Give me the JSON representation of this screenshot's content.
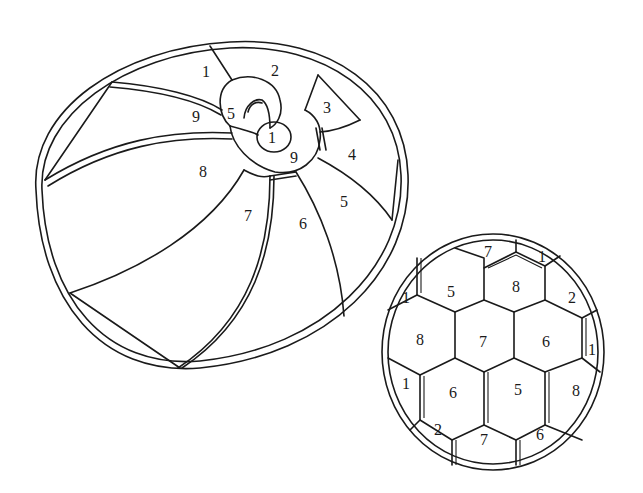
{
  "figures": [
    {
      "name": "beach-ball",
      "regions": [
        {
          "label": "1",
          "x": 206,
          "y": 72
        },
        {
          "label": "2",
          "x": 275,
          "y": 71
        },
        {
          "label": "3",
          "x": 327,
          "y": 108
        },
        {
          "label": "9",
          "x": 196,
          "y": 117
        },
        {
          "label": "5",
          "x": 231,
          "y": 114
        },
        {
          "label": "1",
          "x": 272,
          "y": 138
        },
        {
          "label": "4",
          "x": 352,
          "y": 155
        },
        {
          "label": "9",
          "x": 294,
          "y": 158
        },
        {
          "label": "8",
          "x": 203,
          "y": 172
        },
        {
          "label": "5",
          "x": 344,
          "y": 202
        },
        {
          "label": "7",
          "x": 248,
          "y": 216
        },
        {
          "label": "6",
          "x": 303,
          "y": 224
        }
      ]
    },
    {
      "name": "soccer-ball",
      "regions": [
        {
          "label": "7",
          "x": 488,
          "y": 252
        },
        {
          "label": "1",
          "x": 542,
          "y": 257
        },
        {
          "label": "5",
          "x": 451,
          "y": 292
        },
        {
          "label": "8",
          "x": 516,
          "y": 287
        },
        {
          "label": "1",
          "x": 406,
          "y": 298
        },
        {
          "label": "2",
          "x": 572,
          "y": 298
        },
        {
          "label": "8",
          "x": 420,
          "y": 340
        },
        {
          "label": "7",
          "x": 483,
          "y": 342
        },
        {
          "label": "6",
          "x": 546,
          "y": 342
        },
        {
          "label": "1",
          "x": 592,
          "y": 350
        },
        {
          "label": "1",
          "x": 406,
          "y": 384
        },
        {
          "label": "6",
          "x": 453,
          "y": 393
        },
        {
          "label": "5",
          "x": 518,
          "y": 390
        },
        {
          "label": "8",
          "x": 576,
          "y": 391
        },
        {
          "label": "2",
          "x": 438,
          "y": 430
        },
        {
          "label": "7",
          "x": 484,
          "y": 440
        },
        {
          "label": "6",
          "x": 540,
          "y": 435
        }
      ]
    }
  ],
  "colors": {
    "stroke": "#1a1a1a",
    "background": "#ffffff"
  }
}
